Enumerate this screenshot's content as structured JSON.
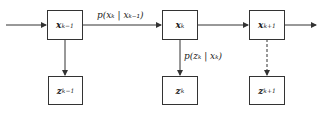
{
  "nodes": {
    "x_prev": {
      "var": "x",
      "sub": "k−1"
    },
    "x_curr": {
      "var": "x",
      "sub": "k"
    },
    "x_next": {
      "var": "x",
      "sub": "k+1"
    },
    "z_prev": {
      "var": "z",
      "sub": "k−1"
    },
    "z_curr": {
      "var": "z",
      "sub": "k"
    },
    "z_next": {
      "var": "z",
      "sub": "k+1"
    }
  },
  "edges": {
    "transition_label": "p(xₖ | xₖ₋₁)",
    "observation_label": "p(zₖ | xₖ)"
  },
  "colors": {
    "line": "#333333",
    "text": "#222222"
  }
}
